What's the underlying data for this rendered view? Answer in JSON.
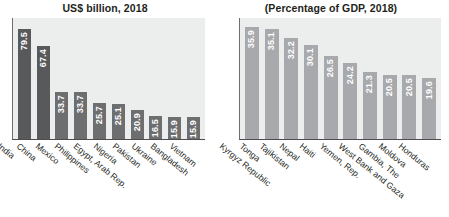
{
  "charts": [
    {
      "title": "US$ billion, 2018",
      "categories": [
        "India",
        "China",
        "Mexico",
        "Philippines",
        "Egypt, Arab Rep.",
        "Nigeria",
        "Pakistan",
        "Ukraine",
        "Bangladesh",
        "Vietnam"
      ],
      "values": [
        79.5,
        67.4,
        33.7,
        33.7,
        25.7,
        25.1,
        20.9,
        16.5,
        15.9,
        15.9
      ],
      "labels": [
        "79.5",
        "67.4",
        "33.7",
        "33.7",
        "25.7",
        "25.1",
        "20.9",
        "16.5",
        "15.9",
        "15.9"
      ]
    },
    {
      "title": "(Percentage of GDP, 2018)",
      "categories": [
        "Kyrgyz Republic",
        "Tonga",
        "Tajikistan",
        "Nepal",
        "Haiti",
        "Yemen, Rep.",
        "West Bank and Gaza",
        "Gambia, The",
        "Moldova",
        "Honduras"
      ],
      "values": [
        35.9,
        35.1,
        32.2,
        30.1,
        26.5,
        24.2,
        21.3,
        20.5,
        20.5,
        19.6
      ],
      "labels": [
        "35.9",
        "35.1",
        "32.2",
        "30.1",
        "26.5",
        "24.2",
        "21.3",
        "20.5",
        "20.5",
        "19.6"
      ]
    }
  ],
  "chart_data": [
    {
      "type": "bar",
      "title": "US$ billion, 2018",
      "xlabel": "",
      "ylabel": "",
      "ylim": [
        0,
        88
      ],
      "grid": false,
      "legend": "none",
      "orientation": "vertical",
      "bar_color_primary": "#595a5c",
      "bar_color_secondary": "#6d6e70",
      "plot_background": "#eceded",
      "categories": [
        "India",
        "China",
        "Mexico",
        "Philippines",
        "Egypt, Arab Rep.",
        "Nigeria",
        "Pakistan",
        "Ukraine",
        "Bangladesh",
        "Vietnam"
      ],
      "values": [
        79.5,
        67.4,
        33.7,
        33.7,
        25.7,
        25.1,
        20.9,
        16.5,
        15.9,
        15.9
      ]
    },
    {
      "type": "bar",
      "title": "(Percentage of GDP, 2018)",
      "xlabel": "",
      "ylabel": "",
      "ylim": [
        0,
        39
      ],
      "grid": false,
      "legend": "none",
      "orientation": "vertical",
      "bar_color_primary": "#a6a8ab",
      "plot_background": "#eceded",
      "categories": [
        "Kyrgyz Republic",
        "Tonga",
        "Tajikistan",
        "Nepal",
        "Haiti",
        "Yemen, Rep.",
        "West Bank and Gaza",
        "Gambia, The",
        "Moldova",
        "Honduras"
      ],
      "values": [
        35.9,
        35.1,
        32.2,
        30.1,
        26.5,
        24.2,
        21.3,
        20.5,
        20.5,
        19.6
      ]
    }
  ]
}
